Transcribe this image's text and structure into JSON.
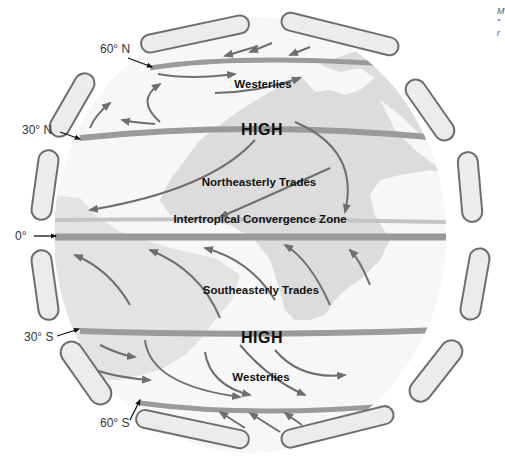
{
  "diagram": {
    "latitude_labels": [
      {
        "id": "lat-60n",
        "text": "60° N"
      },
      {
        "id": "lat-30n",
        "text": "30° N"
      },
      {
        "id": "lat-0",
        "text": "0°"
      },
      {
        "id": "lat-30s",
        "text": "30° S"
      },
      {
        "id": "lat-60s",
        "text": "60° S"
      }
    ],
    "zone_labels": {
      "westerlies_north": "Westerlies",
      "high_north": "HIGH",
      "ne_trades": "Northeasterly Trades",
      "itcz": "Intertropical Convergence Zone",
      "se_trades": "Southeasterly Trades",
      "high_south": "HIGH",
      "westerlies_south": "Westerlies"
    },
    "corner_text": [
      "M",
      "\"",
      "r"
    ],
    "colors": {
      "globe": "#f7f7f7",
      "land": "#dcdcdc",
      "band": "#9a9a9a",
      "arrow": "#6e6e6e",
      "cell_fill": "#ececec",
      "cell_stroke": "#6e6e6e"
    }
  }
}
